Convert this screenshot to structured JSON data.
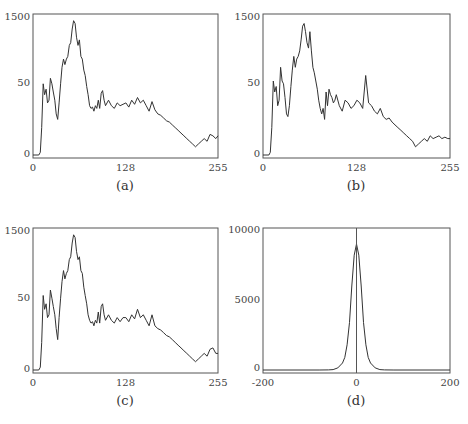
{
  "chart_data": [
    {
      "id": "a",
      "type": "line",
      "caption": "(a)",
      "x_ticks": [
        "0",
        "128",
        "255"
      ],
      "y_ticks": [
        "0",
        "50",
        "1500"
      ],
      "xlim": [
        0,
        255
      ],
      "y_norm_note": "values normalized 0-1 of plot height (axis labels 0, 50, 1500 as printed)",
      "x": [
        0,
        8,
        10,
        12,
        14,
        16,
        18,
        20,
        22,
        24,
        26,
        28,
        30,
        32,
        34,
        36,
        38,
        40,
        42,
        44,
        46,
        48,
        50,
        52,
        54,
        56,
        58,
        60,
        62,
        64,
        66,
        68,
        70,
        72,
        74,
        76,
        78,
        80,
        82,
        84,
        86,
        88,
        90,
        92,
        94,
        96,
        98,
        100,
        104,
        108,
        112,
        116,
        120,
        124,
        128,
        132,
        136,
        140,
        144,
        148,
        152,
        156,
        160,
        164,
        168,
        172,
        176,
        180,
        184,
        188,
        192,
        196,
        200,
        204,
        208,
        212,
        216,
        220,
        224,
        228,
        232,
        236,
        240,
        244,
        248,
        252,
        255
      ],
      "values": [
        0,
        0,
        0.02,
        0.2,
        0.52,
        0.44,
        0.48,
        0.38,
        0.4,
        0.56,
        0.52,
        0.46,
        0.4,
        0.3,
        0.26,
        0.38,
        0.52,
        0.64,
        0.7,
        0.66,
        0.7,
        0.72,
        0.8,
        0.82,
        0.92,
        0.98,
        0.96,
        0.86,
        0.8,
        0.84,
        0.72,
        0.7,
        0.62,
        0.58,
        0.5,
        0.44,
        0.36,
        0.34,
        0.35,
        0.32,
        0.36,
        0.34,
        0.4,
        0.34,
        0.45,
        0.47,
        0.4,
        0.36,
        0.4,
        0.36,
        0.34,
        0.38,
        0.36,
        0.37,
        0.38,
        0.35,
        0.4,
        0.37,
        0.42,
        0.38,
        0.4,
        0.36,
        0.32,
        0.39,
        0.33,
        0.3,
        0.29,
        0.27,
        0.25,
        0.24,
        0.22,
        0.2,
        0.18,
        0.16,
        0.14,
        0.12,
        0.1,
        0.08,
        0.06,
        0.08,
        0.1,
        0.12,
        0.1,
        0.15,
        0.14,
        0.12,
        0.14
      ]
    },
    {
      "id": "b",
      "type": "line",
      "caption": "(b)",
      "x_ticks": [
        "0",
        "128",
        "255"
      ],
      "y_ticks": [
        "0",
        "50",
        "1500"
      ],
      "xlim": [
        0,
        255
      ],
      "x": [
        0,
        8,
        10,
        12,
        14,
        16,
        18,
        20,
        22,
        24,
        26,
        28,
        30,
        32,
        34,
        36,
        38,
        40,
        42,
        44,
        46,
        48,
        50,
        52,
        54,
        56,
        58,
        60,
        62,
        64,
        66,
        68,
        70,
        72,
        74,
        76,
        78,
        80,
        82,
        84,
        86,
        88,
        90,
        92,
        94,
        96,
        98,
        100,
        104,
        108,
        112,
        116,
        120,
        124,
        128,
        132,
        136,
        140,
        144,
        148,
        152,
        156,
        160,
        164,
        168,
        172,
        176,
        180,
        184,
        188,
        192,
        196,
        200,
        204,
        208,
        212,
        216,
        220,
        224,
        228,
        232,
        236,
        240,
        244,
        248,
        252,
        255
      ],
      "values": [
        0,
        0,
        0.02,
        0.2,
        0.54,
        0.46,
        0.5,
        0.36,
        0.4,
        0.64,
        0.54,
        0.52,
        0.42,
        0.3,
        0.28,
        0.36,
        0.5,
        0.62,
        0.72,
        0.64,
        0.7,
        0.72,
        0.76,
        0.84,
        0.94,
        0.96,
        0.9,
        0.82,
        0.78,
        0.9,
        0.76,
        0.64,
        0.6,
        0.54,
        0.48,
        0.4,
        0.34,
        0.3,
        0.34,
        0.26,
        0.46,
        0.36,
        0.48,
        0.44,
        0.42,
        0.38,
        0.4,
        0.44,
        0.36,
        0.32,
        0.4,
        0.38,
        0.34,
        0.36,
        0.4,
        0.38,
        0.34,
        0.58,
        0.38,
        0.36,
        0.32,
        0.3,
        0.34,
        0.28,
        0.26,
        0.27,
        0.24,
        0.22,
        0.2,
        0.18,
        0.16,
        0.14,
        0.12,
        0.1,
        0.06,
        0.08,
        0.1,
        0.12,
        0.1,
        0.14,
        0.12,
        0.13,
        0.14,
        0.12,
        0.13,
        0.12,
        0.12
      ]
    },
    {
      "id": "c",
      "type": "line",
      "caption": "(c)",
      "x_ticks": [
        "0",
        "128",
        "255"
      ],
      "y_ticks": [
        "0",
        "50",
        "1500"
      ],
      "xlim": [
        0,
        255
      ],
      "x": [
        0,
        8,
        10,
        12,
        14,
        16,
        18,
        20,
        22,
        24,
        26,
        28,
        30,
        32,
        34,
        36,
        38,
        40,
        42,
        44,
        46,
        48,
        50,
        52,
        54,
        56,
        58,
        60,
        62,
        64,
        66,
        68,
        70,
        72,
        74,
        76,
        78,
        80,
        82,
        84,
        86,
        88,
        90,
        92,
        94,
        96,
        98,
        100,
        104,
        108,
        112,
        116,
        120,
        124,
        128,
        132,
        136,
        140,
        144,
        148,
        152,
        156,
        160,
        164,
        168,
        172,
        176,
        180,
        184,
        188,
        192,
        196,
        200,
        204,
        208,
        212,
        216,
        220,
        224,
        228,
        232,
        236,
        240,
        244,
        248,
        252,
        255
      ],
      "values": [
        0,
        0,
        0.02,
        0.2,
        0.54,
        0.44,
        0.48,
        0.38,
        0.4,
        0.58,
        0.52,
        0.46,
        0.4,
        0.3,
        0.22,
        0.38,
        0.52,
        0.64,
        0.72,
        0.66,
        0.7,
        0.72,
        0.8,
        0.82,
        0.92,
        0.98,
        0.96,
        0.86,
        0.8,
        0.82,
        0.72,
        0.7,
        0.6,
        0.54,
        0.48,
        0.4,
        0.36,
        0.34,
        0.35,
        0.32,
        0.36,
        0.34,
        0.42,
        0.34,
        0.46,
        0.48,
        0.4,
        0.36,
        0.4,
        0.36,
        0.34,
        0.38,
        0.35,
        0.38,
        0.38,
        0.35,
        0.4,
        0.37,
        0.44,
        0.38,
        0.4,
        0.36,
        0.32,
        0.4,
        0.32,
        0.3,
        0.29,
        0.27,
        0.25,
        0.24,
        0.22,
        0.2,
        0.18,
        0.16,
        0.14,
        0.12,
        0.1,
        0.08,
        0.06,
        0.08,
        0.1,
        0.12,
        0.1,
        0.15,
        0.16,
        0.12,
        0.12
      ]
    },
    {
      "id": "d",
      "type": "line",
      "caption": "(d)",
      "x_ticks": [
        "-200",
        "0",
        "200"
      ],
      "y_ticks": [
        "0",
        "5000",
        "10000"
      ],
      "xlim": [
        -200,
        200
      ],
      "ylim": [
        0,
        10000
      ],
      "vertical_line_at": 0,
      "x": [
        -200,
        -80,
        -60,
        -50,
        -40,
        -30,
        -25,
        -20,
        -15,
        -10,
        -5,
        0,
        5,
        10,
        15,
        20,
        25,
        30,
        40,
        50,
        60,
        80,
        200
      ],
      "values": [
        0,
        0,
        5,
        30,
        150,
        500,
        900,
        1800,
        3400,
        6000,
        8200,
        9000,
        8200,
        6000,
        3400,
        1800,
        900,
        500,
        150,
        30,
        5,
        0,
        0
      ]
    }
  ]
}
